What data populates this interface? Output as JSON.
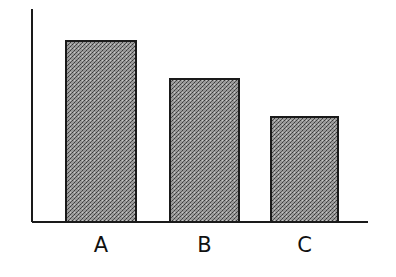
{
  "chart_data": {
    "type": "bar",
    "title": "",
    "xlabel": "",
    "ylabel": "",
    "categories": [
      "A",
      "B",
      "C"
    ],
    "values": [
      181,
      143,
      105
    ],
    "value_units": "relative (pixel height; no axis scale shown)",
    "ylim": [
      0,
      213
    ],
    "grid": false,
    "legend": null,
    "bar_fill": "stippled gray texture",
    "colors": {
      "bar_fill": "#8a8a8a",
      "bar_edge": "#1a1a1a",
      "axis": "#1a1a1a"
    }
  }
}
